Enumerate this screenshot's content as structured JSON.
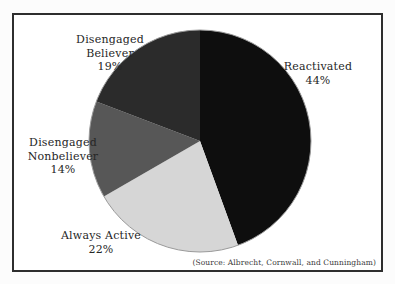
{
  "page": {
    "background": "#fcfcfc"
  },
  "frame": {
    "border_color": "#2e2e2e",
    "background": "#ffffff"
  },
  "chart_data": {
    "type": "pie",
    "title": "",
    "direction": "clockwise",
    "start_angle_deg": 0,
    "center": {
      "x": 186,
      "y": 126
    },
    "radius": 111,
    "outline_color": "#9a9a9a",
    "categories": [
      "Reactivated",
      "Always Active",
      "Disengaged Nonbeliever",
      "Disengaged Believer"
    ],
    "values": [
      44,
      22,
      14,
      19
    ],
    "slices": [
      {
        "label": "Reactivated",
        "pct_text": "44%",
        "value": 44,
        "color": "#0e0e0e"
      },
      {
        "label": "Always Active",
        "pct_text": "22%",
        "value": 22,
        "color": "#d6d6d6"
      },
      {
        "label": "Disengaged Nonbeliever",
        "pct_text": "14%",
        "value": 14,
        "color": "#575757"
      },
      {
        "label": "Disengaged Believer",
        "pct_text": "19%",
        "value": 19,
        "color": "#2b2b2b"
      }
    ],
    "source_note": "(Source: Albrecht, Cornwall, and Cunningham)"
  }
}
